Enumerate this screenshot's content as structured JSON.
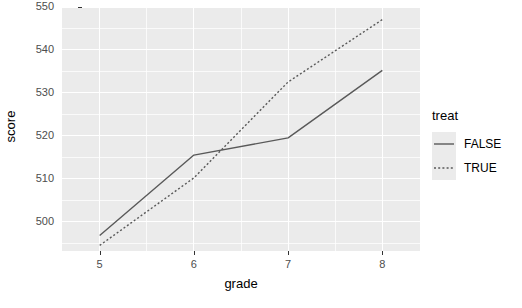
{
  "chart_data": {
    "type": "line",
    "title": "",
    "xlabel": "grade",
    "ylabel": "score",
    "x": [
      5,
      6,
      7,
      8
    ],
    "xtick_labels": [
      "5",
      "6",
      "7",
      "8"
    ],
    "ytick_labels": [
      "500",
      "510",
      "520",
      "530",
      "540",
      "550"
    ],
    "ytick_values": [
      500,
      510,
      520,
      530,
      540,
      550
    ],
    "xlim": [
      4.6,
      8.4
    ],
    "ylim": [
      493.2,
      549.7
    ],
    "grid": true,
    "legend_position": "right",
    "legend_title": "treat",
    "series": [
      {
        "name": "FALSE",
        "linestyle": "solid",
        "color": "#595959",
        "values": [
          496.8,
          515.5,
          519.5,
          535.2
        ]
      },
      {
        "name": "TRUE",
        "linestyle": "dotted",
        "color": "#595959",
        "values": [
          494.5,
          510.2,
          532.5,
          547.0
        ]
      }
    ],
    "panel_background": "#ebebeb",
    "grid_color": "#ffffff"
  },
  "axes": {
    "y_title": "score",
    "x_title": "grade"
  },
  "legend": {
    "title": "treat",
    "items": [
      {
        "label": "FALSE",
        "style": "solid"
      },
      {
        "label": "TRUE",
        "style": "dotted"
      }
    ]
  }
}
